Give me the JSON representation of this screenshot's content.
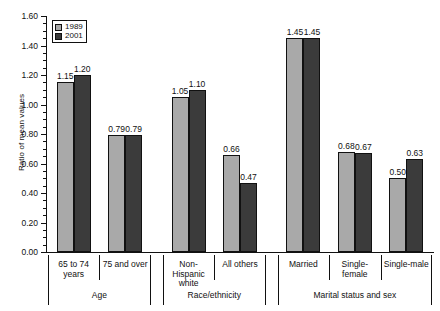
{
  "chart_data": {
    "type": "bar",
    "title": "",
    "xlabel": "",
    "ylabel": "Ratio of mean values",
    "ylim": [
      0.0,
      1.6
    ],
    "ytick_step": 0.2,
    "yminor_step": 0.05,
    "grid": false,
    "legend_position": "top-left",
    "categories": [
      "65 to 74 years",
      "75 and over",
      "Non-Hispanic white",
      "All others",
      "Married",
      "Single-female",
      "Single-male"
    ],
    "series": [
      {
        "name": "1989",
        "color": "#a9a9a9",
        "values": [
          1.15,
          0.79,
          1.05,
          0.66,
          1.45,
          0.68,
          0.5
        ]
      },
      {
        "name": "2001",
        "color": "#3b3b3b",
        "values": [
          1.2,
          0.79,
          1.1,
          0.47,
          1.45,
          0.67,
          0.63
        ]
      }
    ],
    "value_labels": {
      "1989": [
        "1.15",
        "0.79",
        "1.05",
        "0.66",
        "1.45",
        "0.68",
        "0.50"
      ],
      "2001": [
        "1.20",
        "0.79",
        "1.10",
        "0.47",
        "1.45",
        "0.67",
        "0.63"
      ]
    },
    "ytick_labels": [
      "0.00",
      "0.20",
      "0.40",
      "0.60",
      "0.80",
      "1.00",
      "1.20",
      "1.40",
      "1.60"
    ],
    "groups": [
      {
        "label": "Age",
        "categories": [
          "65 to 74 years",
          "75 and over"
        ]
      },
      {
        "label": "Race/ethnicity",
        "categories": [
          "Non-Hispanic white",
          "All others"
        ]
      },
      {
        "label": "Marital status and sex",
        "categories": [
          "Married",
          "Single-female",
          "Single-male"
        ]
      }
    ]
  },
  "axis": {
    "ylabel": "Ratio of mean values",
    "ticks": [
      "0.00",
      "0.20",
      "0.40",
      "0.60",
      "0.80",
      "1.00",
      "1.20",
      "1.40",
      "1.60"
    ]
  },
  "legend": {
    "items": [
      {
        "label": "1989",
        "swatch": "light-gray"
      },
      {
        "label": "2001",
        "swatch": "dark-gray"
      }
    ]
  },
  "categories": [
    {
      "label": "65 to 74 years"
    },
    {
      "label": "75 and over"
    },
    {
      "label": "Non-Hispanic white"
    },
    {
      "label": "All others"
    },
    {
      "label": "Married"
    },
    {
      "label": "Single-female"
    },
    {
      "label": "Single-male"
    }
  ],
  "groups": [
    {
      "label": "Age"
    },
    {
      "label": "Race/ethnicity"
    },
    {
      "label": "Marital status and sex"
    }
  ]
}
